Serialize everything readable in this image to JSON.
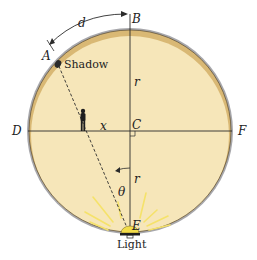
{
  "diagram": {
    "type": "geometry",
    "colors": {
      "background": "#ffffff",
      "disk_fill": "#f6e6b9",
      "disk_shade": "#d9b874",
      "rim": "#a7a7ab",
      "line": "#2b2b2b",
      "light_glow": "#f5e26a",
      "light_dome": "#f2dc4a"
    },
    "points": {
      "A": "A",
      "B": "B",
      "C": "C",
      "D": "D",
      "E": "E",
      "F": "F"
    },
    "labels": {
      "arc_length": "d",
      "radius_top": "r",
      "radius_bottom": "r",
      "horizontal_distance": "x",
      "angle": "θ",
      "shadow": "Shadow",
      "light": "Light"
    }
  }
}
